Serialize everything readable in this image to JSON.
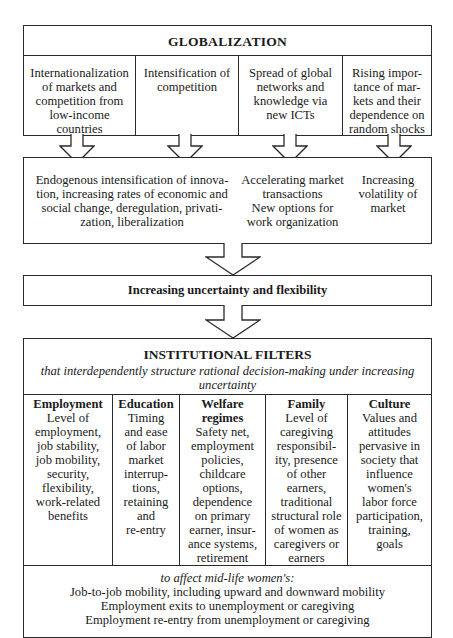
{
  "globalization": {
    "title": "GLOBALIZATION",
    "columns": [
      {
        "lines": [
          "Internationalization",
          "of markets and",
          "competition from",
          "low-income",
          "countries"
        ]
      },
      {
        "lines": [
          "Intensification of",
          "competition"
        ]
      },
      {
        "lines": [
          "Spread of global",
          "networks and",
          "knowledge via",
          "new ICTs"
        ]
      },
      {
        "lines": [
          "Rising impor-",
          "tance of mar-",
          "kets and their",
          "dependence on",
          "random shocks"
        ]
      }
    ]
  },
  "effects": {
    "left_lines": [
      "Endogenous intensification of innova-",
      "tion, increasing rates of economic and",
      "social change, deregulation, privati-",
      "zation, liberalization"
    ],
    "middle_lines": [
      "Accelerating market",
      "transactions",
      "New options for",
      "work organization"
    ],
    "right_lines": [
      "Increasing",
      "volatility of",
      "market"
    ]
  },
  "uncertainty": {
    "title": "Increasing uncertainty and flexibility"
  },
  "institutional_filters": {
    "title": "INSTITUTIONAL FILTERS",
    "subtitle_lines": [
      "that interdependently structure rational decision-making under increasing",
      "uncertainty"
    ],
    "columns": [
      {
        "heading": "Employment",
        "lines": [
          "Level of",
          "employment,",
          "job stability,",
          "job mobility,",
          "security,",
          "flexibility,",
          "work-related",
          "benefits"
        ]
      },
      {
        "heading": "Education",
        "lines": [
          "Timing",
          "and ease",
          "of labor",
          "market",
          "interrup-",
          "tions,",
          "retaining",
          "and",
          "re-entry"
        ]
      },
      {
        "heading": "Welfare regimes",
        "heading_lines": [
          "Welfare",
          "regimes"
        ],
        "lines": [
          "Safety net,",
          "employment",
          "policies,",
          "childcare",
          "options,",
          "dependence",
          "on primary",
          "earner, insur-",
          "ance systems,",
          "retirement"
        ]
      },
      {
        "heading": "Family",
        "lines": [
          "Level of",
          "caregiving",
          "responsibil-",
          "ity, presence",
          "of other",
          "earners,",
          "traditional",
          "structural role",
          "of women as",
          "caregivers or",
          "earners"
        ]
      },
      {
        "heading": "Culture",
        "lines": [
          "Values and",
          "attitudes",
          "pervasive in",
          "society that",
          "influence",
          "women's",
          "labor force",
          "participation,",
          "training,",
          "goals"
        ]
      }
    ],
    "outcomes": {
      "intro": "to affect mid-life women's:",
      "lines": [
        "Job-to-job mobility, including upward and downward mobility",
        "Employment exits to unemployment or caregiving",
        "Employment re-entry from unemployment or caregiving"
      ]
    }
  }
}
